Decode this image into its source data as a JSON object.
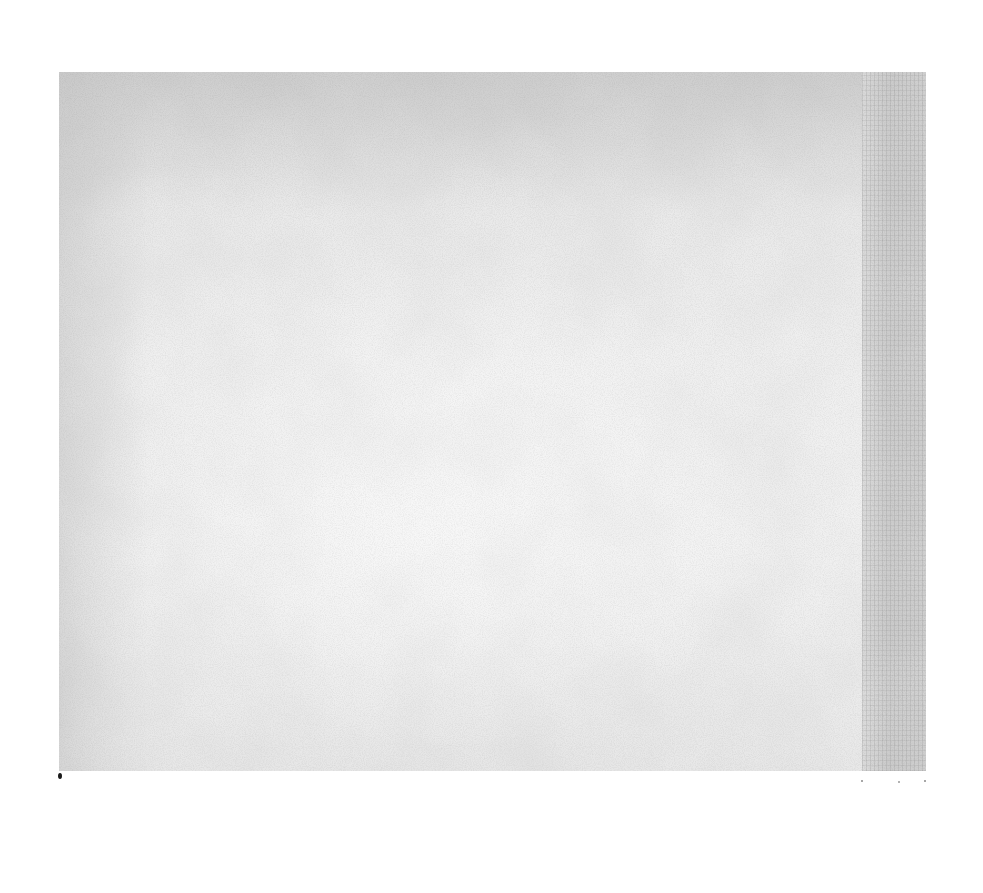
{
  "page": {
    "text": ""
  },
  "sheet": {
    "x": 59,
    "y": 72,
    "width": 867,
    "height": 699,
    "base_color": "#ececec",
    "edge_strip_color": "#d2d2d2"
  },
  "specks": [
    {
      "x": 58,
      "y": 773,
      "w": 4,
      "h": 6,
      "color": "#1a1a1a"
    },
    {
      "x": 861,
      "y": 780,
      "w": 2,
      "h": 2,
      "color": "#8a8a8a"
    },
    {
      "x": 898,
      "y": 781,
      "w": 2,
      "h": 2,
      "color": "#9a9a9a"
    },
    {
      "x": 924,
      "y": 780,
      "w": 2,
      "h": 2,
      "color": "#8a8a8a"
    }
  ]
}
